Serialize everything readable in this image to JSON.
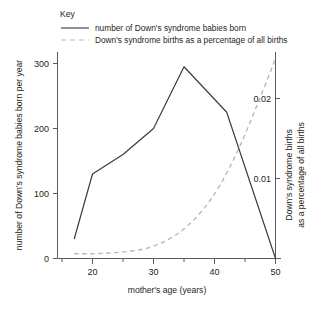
{
  "legend": {
    "title": "Key",
    "entries": [
      {
        "style": "solid",
        "label": "number of Down's syndrome babies born",
        "color": "#3b3b43"
      },
      {
        "style": "dashed",
        "label": "Down's syndrome births as a percentage of all births",
        "color": "#b9b9b9"
      }
    ]
  },
  "axes": {
    "x_title": "mother's age (years)",
    "y_left_title": "number of Down's syndrome babies born per year",
    "y_right_title_line1": "Down's syndrome births",
    "y_right_title_line2": "as a percentage of all births",
    "x_ticks": [
      "20",
      "30",
      "40",
      "50"
    ],
    "y_left_ticks": [
      "0",
      "100",
      "200",
      "300"
    ],
    "y_right_ticks": [
      "0.01",
      "0.02"
    ]
  },
  "chart_data": {
    "type": "line",
    "title": "",
    "xlabel": "mother's age (years)",
    "ylabel": "number of Down's syndrome babies born per year",
    "y2label": "Down's syndrome births as a percentage of all births",
    "xlim": [
      15,
      52
    ],
    "ylim": [
      0,
      330
    ],
    "y2lim": [
      0,
      0.0255
    ],
    "grid": false,
    "legend_position": "above-plot-left",
    "x_ticks": [
      20,
      30,
      40,
      50
    ],
    "x_minor_ticks": [
      25,
      35,
      45
    ],
    "y_ticks": [
      0,
      100,
      200,
      300
    ],
    "y2_ticks": [
      0.01,
      0.02
    ],
    "series": [
      {
        "name": "number of Down's syndrome babies born",
        "axis": "left",
        "style": "solid",
        "color": "#3b3b43",
        "x": [
          17,
          20,
          25,
          30,
          35,
          42,
          50
        ],
        "values": [
          30,
          130,
          160,
          200,
          295,
          225,
          0
        ]
      },
      {
        "name": "Down's syndrome births as a percentage of all births",
        "axis": "right",
        "style": "dashed",
        "color": "#b9b9b9",
        "x": [
          17,
          20,
          23,
          26,
          29,
          32,
          35,
          38,
          41,
          44,
          47,
          50
        ],
        "values": [
          0.0006,
          0.0006,
          0.0007,
          0.0009,
          0.0013,
          0.0022,
          0.0037,
          0.006,
          0.0093,
          0.0138,
          0.0192,
          0.025
        ]
      }
    ]
  }
}
